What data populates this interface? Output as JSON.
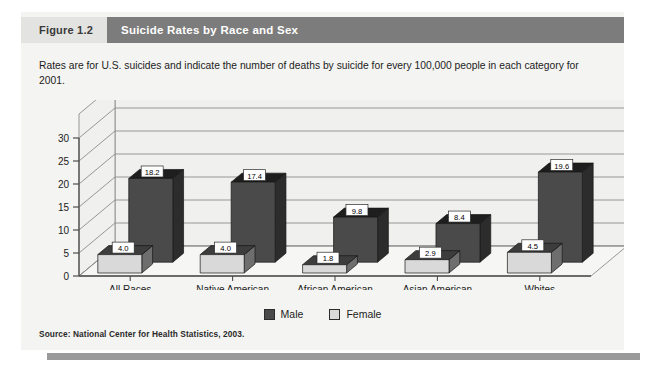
{
  "figure": {
    "number": "Figure 1.2",
    "title": "Suicide Rates by Race and Sex",
    "subtitle": "Rates are for U.S. suicides and indicate the number of deaths by suicide for every 100,000 people in each category for 2001.",
    "source": "Source: National Center for Health Statistics, 2003."
  },
  "legend": {
    "position": "bottom-center",
    "items": [
      {
        "label": "Male",
        "color": "#4a4a4a"
      },
      {
        "label": "Female",
        "color": "#d9d9d9"
      }
    ]
  },
  "colors": {
    "title_band": "#7c7c7c",
    "figure_number_band": "#e3e3e1",
    "card_background": "#f4f4f2",
    "male": "#4a4a4a",
    "male_top": "#1e1e1e",
    "male_side": "#2c2c2c",
    "female": "#d9d9d9",
    "female_top": "#3d3d3d",
    "female_side": "#6e6e6e",
    "axis": "#4d4d4d",
    "gridline": "#8c8c8c",
    "wall": "#f0f0ee",
    "bottom_rule": "#9a9a9a"
  },
  "chart_data": {
    "type": "bar",
    "title": "Suicide Rates by Race and Sex",
    "xlabel": "",
    "ylabel": "",
    "ylim": [
      0,
      30
    ],
    "yticks": [
      0,
      5,
      10,
      15,
      20,
      25,
      30
    ],
    "ytick_labels": [
      "0",
      "5",
      "10",
      "15",
      "20",
      "25",
      "30"
    ],
    "grid": true,
    "three_d": true,
    "categories": [
      "All Races",
      "Native American",
      "African American",
      "Asian American",
      "Whites"
    ],
    "series": [
      {
        "name": "Male",
        "values": [
          18.2,
          17.4,
          9.8,
          8.4,
          19.6
        ],
        "labels": [
          "18.2",
          "17.4",
          "9.8",
          "8.4",
          "19.6"
        ]
      },
      {
        "name": "Female",
        "values": [
          4.0,
          4.0,
          1.8,
          2.9,
          4.5
        ],
        "labels": [
          "4.0",
          "4.0",
          "1.8",
          "2.9",
          "4.5"
        ]
      }
    ]
  }
}
